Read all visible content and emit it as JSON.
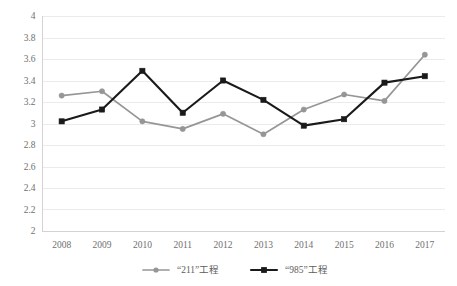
{
  "chart_data": {
    "type": "line",
    "title": "",
    "subtitle": "",
    "xlabel": "",
    "ylabel": "",
    "categories": [
      "2008",
      "2009",
      "2010",
      "2011",
      "2012",
      "2013",
      "2014",
      "2015",
      "2016",
      "2017"
    ],
    "x": [
      2008,
      2009,
      2010,
      2011,
      2012,
      2013,
      2014,
      2015,
      2016,
      2017
    ],
    "ylim": [
      2,
      4
    ],
    "yticks": [
      "2",
      "2.2",
      "2.4",
      "2.6",
      "2.8",
      "3",
      "3.2",
      "3.4",
      "3.6",
      "3.8",
      "4"
    ],
    "ytick_values": [
      2,
      2.2,
      2.4,
      2.6,
      2.8,
      3,
      3.2,
      3.4,
      3.6,
      3.8,
      4
    ],
    "grid": true,
    "grid_axis": "y",
    "legend_position": "bottom",
    "series": [
      {
        "name": "“211”工程",
        "color": "#969696",
        "marker": "circle",
        "values": [
          3.26,
          3.3,
          3.02,
          2.95,
          3.09,
          2.9,
          3.13,
          3.27,
          3.21,
          3.64
        ]
      },
      {
        "name": "“985”工程",
        "color": "#1a1a1a",
        "marker": "square",
        "values": [
          3.02,
          3.13,
          3.49,
          3.1,
          3.4,
          3.22,
          2.98,
          3.04,
          3.38,
          3.44
        ]
      }
    ]
  },
  "legend": {
    "items": [
      {
        "label": "“211”工程",
        "color": "#969696",
        "marker": "circle-marker"
      },
      {
        "label": "“985”工程",
        "color": "#1a1a1a",
        "marker": "square-marker"
      }
    ]
  },
  "colors": {
    "series_211": "#969696",
    "series_985": "#1a1a1a",
    "gridline": "#eceaea",
    "axis": "#d4d2d2",
    "tick_text": "#6f6f6f",
    "legend_text": "#5d5d5d",
    "background": "#ffffff"
  }
}
